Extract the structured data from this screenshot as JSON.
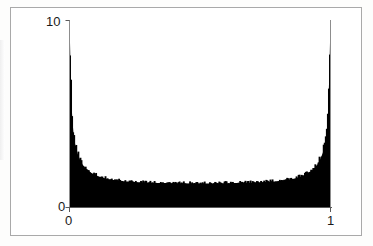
{
  "figure": {
    "frame_color": "#a9a9a9",
    "background_color": "#ffffff",
    "ink_color": "#000000"
  },
  "axes": {
    "y_top_label": "10",
    "y_bottom_label": "0",
    "x_left_label": "0",
    "x_right_label": "1"
  },
  "chart_data": {
    "type": "area",
    "title": "",
    "subtitle": "",
    "xlabel": "",
    "ylabel": "",
    "xlim": [
      0,
      1
    ],
    "ylim": [
      0,
      10
    ],
    "xticks": [
      0,
      1
    ],
    "xticklabels": [
      "0",
      "1"
    ],
    "yticks": [
      0,
      10
    ],
    "yticklabels": [
      "0",
      "10"
    ],
    "grid": false,
    "legend": null,
    "legend_position": "none",
    "annotations": [],
    "series": [
      {
        "name": "density",
        "fill": "#000000",
        "x": [
          0.0,
          0.005,
          0.01,
          0.015,
          0.02,
          0.025,
          0.03,
          0.04,
          0.05,
          0.06,
          0.07,
          0.08,
          0.09,
          0.1,
          0.12,
          0.14,
          0.16,
          0.18,
          0.2,
          0.25,
          0.3,
          0.35,
          0.4,
          0.45,
          0.5,
          0.55,
          0.6,
          0.65,
          0.7,
          0.75,
          0.8,
          0.82,
          0.84,
          0.86,
          0.88,
          0.9,
          0.91,
          0.92,
          0.93,
          0.94,
          0.95,
          0.96,
          0.97,
          0.975,
          0.98,
          0.985,
          0.99,
          0.995,
          1.0
        ],
        "y": [
          10.0,
          6.9,
          4.9,
          4.0,
          3.5,
          3.15,
          2.9,
          2.55,
          2.3,
          2.12,
          1.99,
          1.88,
          1.8,
          1.73,
          1.62,
          1.54,
          1.49,
          1.44,
          1.41,
          1.36,
          1.33,
          1.31,
          1.3,
          1.29,
          1.29,
          1.29,
          1.3,
          1.31,
          1.33,
          1.36,
          1.41,
          1.44,
          1.49,
          1.54,
          1.62,
          1.73,
          1.8,
          1.88,
          1.99,
          2.12,
          2.3,
          2.55,
          2.9,
          3.15,
          3.5,
          4.0,
          4.9,
          6.9,
          10.0
        ]
      }
    ]
  }
}
